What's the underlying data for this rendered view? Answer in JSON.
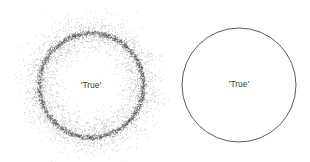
{
  "panels": [
    {
      "name": "noisy-circle",
      "label": "'True'",
      "center": [
        91,
        85
      ],
      "radius": 52,
      "style": "scattered points with radial noise",
      "color": "#555555"
    },
    {
      "name": "clean-circle",
      "label": "'True'",
      "center": [
        239,
        85
      ],
      "radius": 57,
      "style": "thin outline",
      "color": "#444444"
    }
  ]
}
